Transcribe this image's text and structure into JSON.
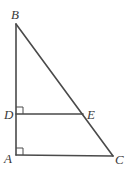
{
  "diagram": {
    "type": "right-triangle-with-parallel-segment",
    "points": {
      "A": {
        "label": "A",
        "x": 16,
        "y": 155
      },
      "B": {
        "label": "B",
        "x": 16,
        "y": 24
      },
      "C": {
        "label": "C",
        "x": 113,
        "y": 156
      },
      "D": {
        "label": "D",
        "x": 16,
        "y": 114
      },
      "E": {
        "label": "E",
        "x": 83,
        "y": 114
      }
    },
    "segments": [
      "AB",
      "BC",
      "AC",
      "DE"
    ],
    "right_angles": [
      "D",
      "A"
    ],
    "colors": {
      "stroke": "#4a4a4a",
      "label": "#3a3a3a",
      "background": "#ffffff"
    }
  }
}
